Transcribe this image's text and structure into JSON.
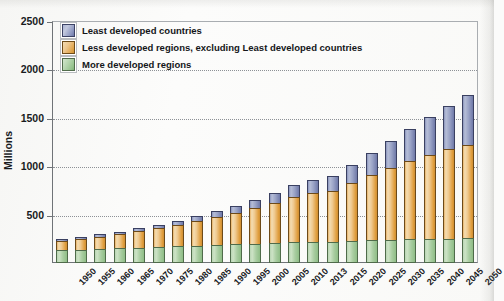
{
  "chart_data": {
    "type": "bar",
    "title": "",
    "xlabel": "",
    "ylabel": "Millions",
    "ylim": [
      0,
      2500
    ],
    "yticks": [
      500,
      1000,
      1500,
      2000,
      2500
    ],
    "grid": true,
    "stacked": true,
    "legend_position": "top-left",
    "categories": [
      "1950",
      "1955",
      "1960",
      "1965",
      "1970",
      "1975",
      "1980",
      "1985",
      "1990",
      "1995",
      "2000",
      "2005",
      "2010",
      "2013",
      "2015",
      "2020",
      "2025",
      "2030",
      "2035",
      "2040",
      "2045",
      "2050"
    ],
    "series": [
      {
        "name": "More developed regions",
        "color": "#9ac792",
        "values": [
          130,
          137,
          145,
          152,
          160,
          167,
          173,
          180,
          187,
          193,
          198,
          205,
          212,
          216,
          219,
          227,
          234,
          240,
          245,
          250,
          253,
          255
        ]
      },
      {
        "name": "Less developed regions, excluding Least developed countries",
        "color": "#e0a44a",
        "values": [
          100,
          113,
          127,
          145,
          168,
          193,
          220,
          252,
          288,
          328,
          372,
          420,
          472,
          505,
          528,
          600,
          672,
          742,
          808,
          868,
          922,
          968
        ]
      },
      {
        "name": "Least developed countries",
        "color": "#8d97c0",
        "values": [
          18,
          20,
          23,
          26,
          30,
          35,
          41,
          49,
          58,
          70,
          85,
          103,
          124,
          140,
          151,
          190,
          234,
          282,
          335,
          392,
          452,
          512
        ]
      }
    ],
    "totals": [
      248,
      270,
      295,
      323,
      358,
      395,
      434,
      481,
      533,
      591,
      655,
      728,
      808,
      861,
      898,
      1017,
      1140,
      1264,
      1388,
      1510,
      1627,
      1735
    ]
  },
  "legend": {
    "items": [
      {
        "label": "Least developed countries",
        "swatch": "least"
      },
      {
        "label": "Less developed regions, excluding Least developed countries",
        "swatch": "less"
      },
      {
        "label": "More developed regions",
        "swatch": "more"
      }
    ]
  },
  "axis": {
    "y_title": "Millions"
  }
}
